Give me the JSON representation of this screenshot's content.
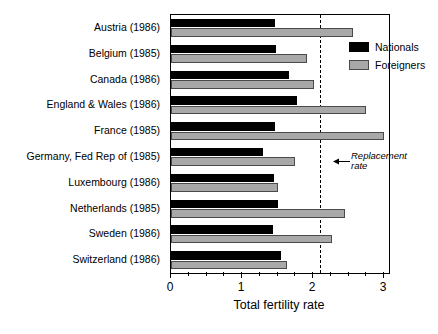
{
  "chart_data": {
    "type": "bar",
    "orientation": "horizontal",
    "title": "",
    "xlabel": "Total fertility rate",
    "ylabel": "",
    "xlim": [
      0,
      3.07
    ],
    "xticks": [
      0,
      1,
      2,
      3
    ],
    "xticklabels": [
      "0",
      "1",
      "2",
      "3"
    ],
    "minor_ticks": [
      0.25,
      0.5,
      0.75,
      1.25,
      1.5,
      1.75,
      2.25,
      2.5,
      2.75
    ],
    "grid": false,
    "legend_position": "top-right inside",
    "categories": [
      "Austria (1986)",
      "Belgium (1985)",
      "Canada (1986)",
      "England & Wales (1986)",
      "France (1985)",
      "Germany, Fed Rep of (1985)",
      "Luxembourg (1986)",
      "Netherlands (1985)",
      "Sweden (1986)",
      "Switzerland (1986)"
    ],
    "series": [
      {
        "name": "Nationals",
        "color": "#000000",
        "values": [
          1.46,
          1.48,
          1.66,
          1.78,
          1.46,
          1.3,
          1.45,
          1.5,
          1.43,
          1.55
        ]
      },
      {
        "name": "Foreigners",
        "color": "#a8a8a8",
        "values": [
          2.56,
          1.92,
          2.02,
          2.74,
          3.0,
          1.75,
          1.5,
          2.45,
          2.27,
          1.63
        ]
      }
    ],
    "annotations": [
      {
        "name": "replacement-rate",
        "text_line1": "Replacement",
        "text_line2": "rate",
        "value": 2.1,
        "style": "dashed vertical line with left arrow"
      }
    ]
  },
  "legend": {
    "items": [
      {
        "label": "Nationals",
        "color": "#000000"
      },
      {
        "label": "Foreigners",
        "color": "#a8a8a8"
      }
    ]
  }
}
